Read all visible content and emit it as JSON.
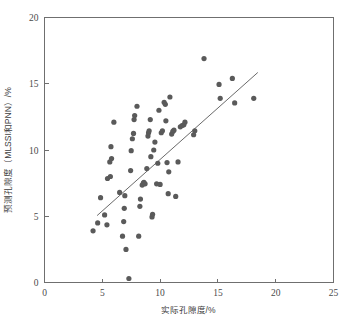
{
  "chart_data": {
    "type": "scatter",
    "title": "",
    "xlabel": "实际孔隙度/%",
    "ylabel": "预测孔隙度（MLSSI和PNN）/%",
    "xlim": [
      0,
      25
    ],
    "ylim": [
      0,
      20
    ],
    "xticks": [
      0,
      5,
      10,
      15,
      20,
      25
    ],
    "yticks": [
      0,
      5,
      10,
      15,
      20
    ],
    "xtick_labels": [
      "0",
      "5",
      "10",
      "15",
      "20",
      "25"
    ],
    "ytick_labels": [
      "0",
      "5",
      "10",
      "15",
      "20"
    ],
    "grid": false,
    "legend": false,
    "marker_color": "#5a5a5a",
    "marker_radius": 2.6,
    "trend_line": {
      "name": "regression-line",
      "color": "#6a6a6a",
      "x_start": 4.55,
      "y_start": 5.05,
      "x_end": 18.45,
      "y_end": 15.85
    },
    "points": [
      {
        "x": 4.2,
        "y": 3.9
      },
      {
        "x": 4.6,
        "y": 4.5
      },
      {
        "x": 5.4,
        "y": 4.35
      },
      {
        "x": 4.85,
        "y": 6.4
      },
      {
        "x": 5.2,
        "y": 5.1
      },
      {
        "x": 5.45,
        "y": 7.85
      },
      {
        "x": 5.65,
        "y": 9.1
      },
      {
        "x": 5.7,
        "y": 8.0
      },
      {
        "x": 5.75,
        "y": 10.25
      },
      {
        "x": 5.8,
        "y": 9.35
      },
      {
        "x": 6.0,
        "y": 12.1
      },
      {
        "x": 6.5,
        "y": 6.8
      },
      {
        "x": 6.75,
        "y": 3.5
      },
      {
        "x": 6.85,
        "y": 4.6
      },
      {
        "x": 6.9,
        "y": 5.6
      },
      {
        "x": 6.95,
        "y": 6.55
      },
      {
        "x": 7.05,
        "y": 2.5
      },
      {
        "x": 7.3,
        "y": 0.3
      },
      {
        "x": 7.45,
        "y": 8.45
      },
      {
        "x": 7.5,
        "y": 9.95
      },
      {
        "x": 7.6,
        "y": 10.85
      },
      {
        "x": 7.7,
        "y": 11.25
      },
      {
        "x": 7.75,
        "y": 12.3
      },
      {
        "x": 7.8,
        "y": 12.6
      },
      {
        "x": 8.0,
        "y": 13.3
      },
      {
        "x": 8.15,
        "y": 3.5
      },
      {
        "x": 8.25,
        "y": 5.75
      },
      {
        "x": 8.3,
        "y": 6.3
      },
      {
        "x": 8.45,
        "y": 7.35
      },
      {
        "x": 8.55,
        "y": 7.5
      },
      {
        "x": 8.6,
        "y": 7.55
      },
      {
        "x": 8.7,
        "y": 7.45
      },
      {
        "x": 8.85,
        "y": 8.6
      },
      {
        "x": 8.95,
        "y": 11.05
      },
      {
        "x": 9.0,
        "y": 11.3
      },
      {
        "x": 9.05,
        "y": 11.45
      },
      {
        "x": 9.15,
        "y": 12.3
      },
      {
        "x": 9.2,
        "y": 9.5
      },
      {
        "x": 9.3,
        "y": 4.95
      },
      {
        "x": 9.35,
        "y": 5.15
      },
      {
        "x": 9.45,
        "y": 10.0
      },
      {
        "x": 9.55,
        "y": 10.6
      },
      {
        "x": 9.7,
        "y": 7.45
      },
      {
        "x": 9.8,
        "y": 9.0
      },
      {
        "x": 9.9,
        "y": 13.0
      },
      {
        "x": 10.0,
        "y": 7.4
      },
      {
        "x": 10.1,
        "y": 11.3
      },
      {
        "x": 10.2,
        "y": 11.45
      },
      {
        "x": 10.35,
        "y": 13.6
      },
      {
        "x": 10.45,
        "y": 13.45
      },
      {
        "x": 10.5,
        "y": 12.2
      },
      {
        "x": 10.6,
        "y": 9.05
      },
      {
        "x": 10.7,
        "y": 6.7
      },
      {
        "x": 10.75,
        "y": 8.35
      },
      {
        "x": 10.85,
        "y": 14.0
      },
      {
        "x": 11.0,
        "y": 11.2
      },
      {
        "x": 11.1,
        "y": 11.4
      },
      {
        "x": 11.2,
        "y": 11.5
      },
      {
        "x": 11.35,
        "y": 6.5
      },
      {
        "x": 11.55,
        "y": 9.1
      },
      {
        "x": 11.75,
        "y": 11.75
      },
      {
        "x": 11.9,
        "y": 11.85
      },
      {
        "x": 12.05,
        "y": 11.9
      },
      {
        "x": 12.15,
        "y": 12.1
      },
      {
        "x": 12.9,
        "y": 11.15
      },
      {
        "x": 13.0,
        "y": 11.45
      },
      {
        "x": 13.8,
        "y": 16.9
      },
      {
        "x": 15.1,
        "y": 14.95
      },
      {
        "x": 15.2,
        "y": 13.9
      },
      {
        "x": 16.25,
        "y": 15.4
      },
      {
        "x": 16.45,
        "y": 13.55
      },
      {
        "x": 18.1,
        "y": 13.9
      }
    ]
  },
  "axes": {
    "x_axis_name": "x-axis",
    "y_axis_name": "y-axis"
  }
}
